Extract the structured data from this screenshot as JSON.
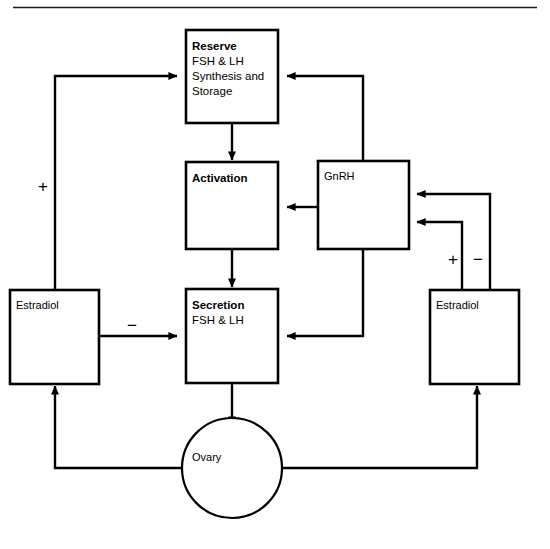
{
  "figure": {
    "type": "flow-diagram",
    "top_rule": true
  },
  "nodes": {
    "reserve": {
      "id": "reserve",
      "shape": "box",
      "title": "Reserve",
      "lines": [
        "FSH & LH",
        "Synthesis and",
        "Storage"
      ]
    },
    "activation": {
      "id": "activation",
      "shape": "box",
      "title": "Activation",
      "lines": []
    },
    "secretion": {
      "id": "secretion",
      "shape": "box",
      "title": "Secretion",
      "lines": [
        "FSH & LH"
      ]
    },
    "gnrh": {
      "id": "gnrh",
      "shape": "box",
      "title": "GnRH",
      "lines": []
    },
    "estradiol_left": {
      "id": "estradiol-left",
      "shape": "box",
      "title": "Estradiol",
      "lines": []
    },
    "estradiol_right": {
      "id": "estradiol-right",
      "shape": "box",
      "title": "Estradiol",
      "lines": []
    },
    "ovary": {
      "id": "ovary",
      "shape": "circle",
      "title": "Ovary",
      "lines": []
    }
  },
  "signs": {
    "left_positive": "+",
    "secretion_negative": "−",
    "gnrh_positive": "+",
    "gnrh_negative": "−"
  },
  "edges": [
    {
      "name": "reserve-to-activation",
      "from": "reserve",
      "to": "activation",
      "arrow": true
    },
    {
      "name": "activation-to-secretion",
      "from": "activation",
      "to": "secretion",
      "arrow": true
    },
    {
      "name": "secretion-to-ovary",
      "from": "secretion",
      "to": "ovary",
      "arrow": true
    },
    {
      "name": "gnrh-to-reserve",
      "from": "gnrh",
      "to": "reserve",
      "arrow": true
    },
    {
      "name": "gnrh-to-activation",
      "from": "gnrh",
      "to": "activation",
      "arrow": true
    },
    {
      "name": "gnrh-to-secretion",
      "from": "gnrh",
      "to": "secretion",
      "arrow": true
    },
    {
      "name": "estradiol-left-to-secretion",
      "from": "estradiol_left",
      "to": "secretion",
      "arrow": true,
      "sign": "−"
    },
    {
      "name": "estradiol-left-to-reserve",
      "from": "estradiol_left",
      "to": "reserve",
      "arrow": true,
      "sign": "+"
    },
    {
      "name": "estradiol-right-to-gnrh-positive",
      "from": "estradiol_right",
      "to": "gnrh",
      "arrow": true,
      "sign": "+"
    },
    {
      "name": "estradiol-right-to-gnrh-negative",
      "from": "estradiol_right",
      "to": "gnrh",
      "arrow": true,
      "sign": "−"
    },
    {
      "name": "ovary-to-estradiol-left",
      "from": "ovary",
      "to": "estradiol_left",
      "arrow": true
    },
    {
      "name": "ovary-to-estradiol-right",
      "from": "ovary",
      "to": "estradiol_right",
      "arrow": true
    }
  ],
  "colors": {
    "stroke": "#000000",
    "background": "#ffffff",
    "rule": "#1a1a1a"
  }
}
